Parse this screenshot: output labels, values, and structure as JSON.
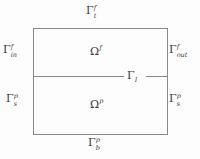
{
  "figure": {
    "name": "stokes-darcy-domain-diagram",
    "background_color": "#fdfdfd",
    "line_color": "#8a8a8a",
    "text_color": "#3a3a3a"
  },
  "labels": {
    "top_boundary": {
      "base": "Γ",
      "sub": "t",
      "sup": "f",
      "full": "Γ_t^f"
    },
    "inlet_boundary": {
      "base": "Γ",
      "sub": "in",
      "sup": "f",
      "full": "Γ_in^f"
    },
    "outlet_boundary": {
      "base": "Γ",
      "sub": "out",
      "sup": "f",
      "full": "Γ_out^f"
    },
    "left_porous_boundary": {
      "base": "Γ",
      "sub": "s",
      "sup": "p",
      "full": "Γ_s^p"
    },
    "right_porous_boundary": {
      "base": "Γ",
      "sub": "s",
      "sup": "p",
      "full": "Γ_s^p"
    },
    "bottom_boundary": {
      "base": "Γ",
      "sub": "b",
      "sup": "p",
      "full": "Γ_b^p"
    },
    "fluid_domain": {
      "base": "Ω",
      "sub": "",
      "sup": "f",
      "full": "Ω^f"
    },
    "porous_domain": {
      "base": "Ω",
      "sub": "",
      "sup": "p",
      "full": "Ω^p"
    },
    "interface": {
      "base": "Γ",
      "sub": "I",
      "sup": "",
      "full": "Γ_I"
    }
  },
  "geometry": {
    "rectangle": {
      "x": 33,
      "y": 28,
      "width": 135,
      "height": 107
    },
    "interface_line": {
      "x1": 33,
      "y1": 76,
      "x2": 168,
      "y2": 76
    }
  }
}
